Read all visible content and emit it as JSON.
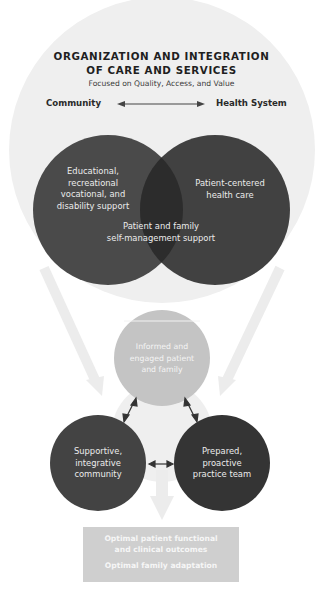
{
  "header": {
    "title_line1": "ORGANIZATION AND INTEGRATION",
    "title_line2": "OF CARE AND SERVICES",
    "subtitle": "Focused on Quality, Access, and Value",
    "left_label": "Community",
    "right_label": "Health System"
  },
  "venn": {
    "left": [
      "Educational,",
      "recreational",
      "vocational, and",
      "disability support"
    ],
    "right": [
      "Patient-centered",
      "health care"
    ],
    "overlap": [
      "Patient and family",
      "self-management support"
    ]
  },
  "triangle": {
    "top": [
      "Informed and",
      "engaged patient",
      "and family"
    ],
    "left": [
      "Supportive,",
      "integrative",
      "community"
    ],
    "right": [
      "Prepared,",
      "proactive",
      "practice team"
    ]
  },
  "outcomes": {
    "line1": "Optimal patient functional",
    "line2": "and clinical outcomes",
    "line3": "Optimal family adaptation"
  },
  "colors": {
    "outer_circle": "#efefef",
    "left_circle": "#4a4a4a",
    "right_circle": "#414141",
    "overlap": "#2c2c2c",
    "top_circle": "#c4c4c4",
    "left_small_circle": "#434343",
    "right_small_circle": "#343434",
    "arrows": "#ececec",
    "outcome_box": "#cfcfcf"
  }
}
